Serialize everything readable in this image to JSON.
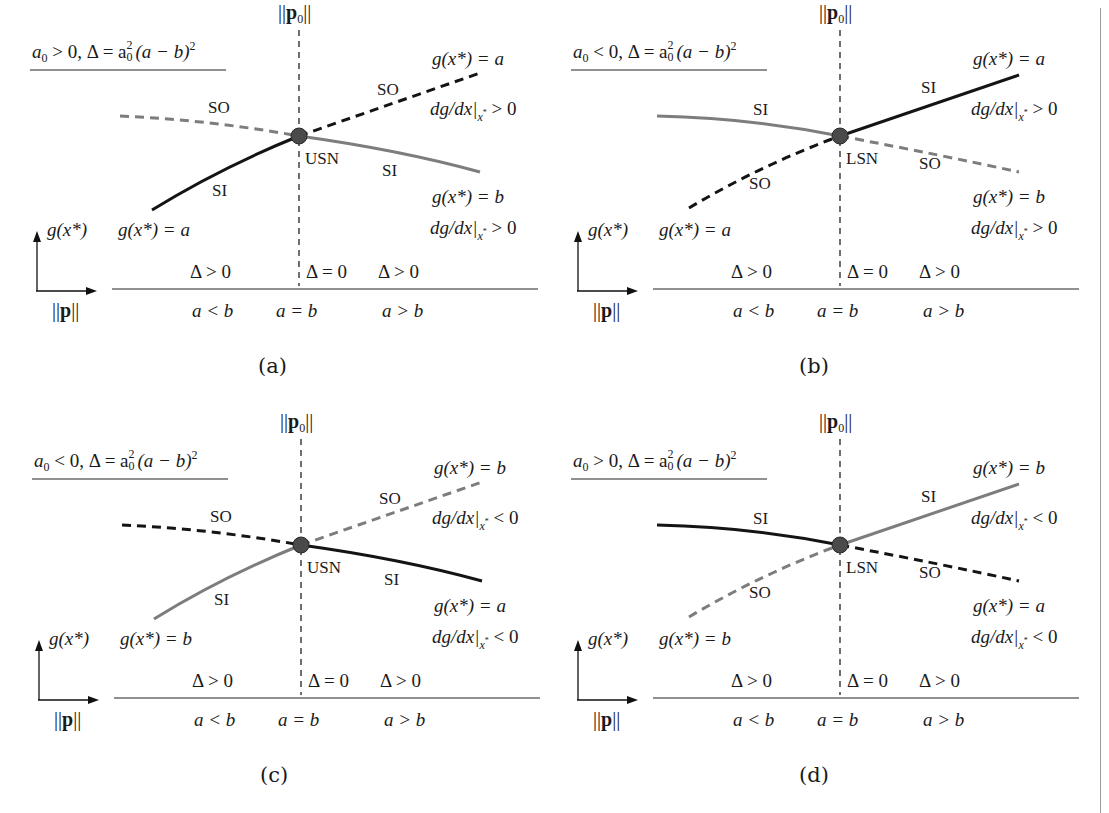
{
  "figure": {
    "colors": {
      "black_branch": "#141414",
      "gray_branch": "#7d7d7d",
      "node": "#4a4a4a",
      "axis": "#222222"
    }
  },
  "common": {
    "p0_label_norm": "||",
    "p0_label_p": "p",
    "p0_label_sub": "0",
    "y_axis_label": "g(x*)",
    "x_axis_label_p": "p",
    "x_axis_norm": "||",
    "delta_left": "Δ > 0",
    "delta_mid": "Δ = 0",
    "delta_right": "Δ > 0",
    "cond_left": "a < b",
    "cond_mid": "a = b",
    "cond_right": "a > b",
    "title_delta": ", Δ = a",
    "title_tail": "(a − b)",
    "title_sup2": "2",
    "title_sub0": "0",
    "title_a": "a"
  },
  "panels": [
    {
      "id": "a",
      "caption": "(a)",
      "title_sign": "> 0",
      "node_label": "USN",
      "left_upper_label": "SO",
      "left_lower_label": "SI",
      "right_upper_label": "SO",
      "right_lower_label": "SI",
      "top_right_eq": "g(x*) = a",
      "top_right_deriv": "dg/dx|x* > 0",
      "mid_right_eq": "g(x*) = b",
      "mid_right_deriv": "dg/dx|x* > 0",
      "bottom_left_eq": "g(x*) = a",
      "branches": {
        "left_upper": {
          "style": "dashed",
          "color": "gray",
          "stability": "SO"
        },
        "left_lower": {
          "style": "solid",
          "color": "black",
          "stability": "SI"
        },
        "right_upper": {
          "style": "dashed",
          "color": "black",
          "stability": "SO"
        },
        "right_lower": {
          "style": "solid",
          "color": "gray",
          "stability": "SI"
        }
      }
    },
    {
      "id": "b",
      "caption": "(b)",
      "title_sign": "< 0",
      "node_label": "LSN",
      "left_upper_label": "SI",
      "left_lower_label": "SO",
      "right_upper_label": "SI",
      "right_lower_label": "SO",
      "top_right_eq": "g(x*) = a",
      "top_right_deriv": "dg/dx|x* > 0",
      "mid_right_eq": "g(x*) = b",
      "mid_right_deriv": "dg/dx|x* > 0",
      "bottom_left_eq": "g(x*) = a",
      "branches": {
        "left_upper": {
          "style": "solid",
          "color": "gray",
          "stability": "SI"
        },
        "left_lower": {
          "style": "dashed",
          "color": "black",
          "stability": "SO"
        },
        "right_upper": {
          "style": "solid",
          "color": "black",
          "stability": "SI"
        },
        "right_lower": {
          "style": "dashed",
          "color": "gray",
          "stability": "SO"
        }
      }
    },
    {
      "id": "c",
      "caption": "(c)",
      "title_sign": "< 0",
      "node_label": "USN",
      "left_upper_label": "SO",
      "left_lower_label": "SI",
      "right_upper_label": "SO",
      "right_lower_label": "SI",
      "top_right_eq": "g(x*) = b",
      "top_right_deriv": "dg/dx|x* < 0",
      "mid_right_eq": "g(x*) = a",
      "mid_right_deriv": "dg/dx|x* < 0",
      "bottom_left_eq": "g(x*) = b",
      "branches": {
        "left_upper": {
          "style": "dashed",
          "color": "black",
          "stability": "SO"
        },
        "left_lower": {
          "style": "solid",
          "color": "gray",
          "stability": "SI"
        },
        "right_upper": {
          "style": "dashed",
          "color": "gray",
          "stability": "SO"
        },
        "right_lower": {
          "style": "solid",
          "color": "black",
          "stability": "SI"
        }
      }
    },
    {
      "id": "d",
      "caption": "(d)",
      "title_sign": "> 0",
      "node_label": "LSN",
      "left_upper_label": "SI",
      "left_lower_label": "SO",
      "right_upper_label": "SI",
      "right_lower_label": "SO",
      "top_right_eq": "g(x*) = b",
      "top_right_deriv": "dg/dx|x* < 0",
      "mid_right_eq": "g(x*) = a",
      "mid_right_deriv": "dg/dx|x* < 0",
      "bottom_left_eq": "g(x*) = b",
      "branches": {
        "left_upper": {
          "style": "solid",
          "color": "black",
          "stability": "SI"
        },
        "left_lower": {
          "style": "dashed",
          "color": "gray",
          "stability": "SO"
        },
        "right_upper": {
          "style": "solid",
          "color": "gray",
          "stability": "SI"
        },
        "right_lower": {
          "style": "dashed",
          "color": "black",
          "stability": "SO"
        }
      }
    }
  ]
}
